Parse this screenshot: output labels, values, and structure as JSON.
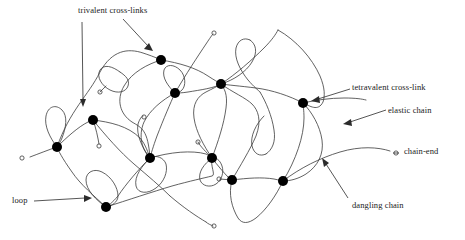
{
  "figure": {
    "type": "polymer-network-diagram",
    "width": 465,
    "height": 240,
    "background_color": "#ffffff"
  },
  "style": {
    "chain_color": "#3a3a3a",
    "node_color": "#000000",
    "label_color": "#1a1a1a",
    "leader_color": "#2b2b2b",
    "chain_stroke_width": 0.8,
    "node_radius": 5
  },
  "labels": {
    "trivalent": "trivalent cross-links",
    "tetravalent": "tetravalent cross-link",
    "elastic": "elastic chain",
    "chain_end": "chain-end",
    "dangling": "dangling chain",
    "loop": "loop"
  },
  "legend_items": [
    {
      "name": "trivalent-cross-links",
      "label": "trivalent cross-links",
      "marker": "filled-circle-node",
      "valence": 3
    },
    {
      "name": "tetravalent-cross-link",
      "label": "tetravalent cross-link",
      "marker": "filled-circle-node",
      "valence": 4
    },
    {
      "name": "elastic-chain",
      "label": "elastic chain",
      "marker": "curve-between-nodes"
    },
    {
      "name": "chain-end",
      "label": "chain-end",
      "marker": "small-open-circle"
    },
    {
      "name": "dangling-chain",
      "label": "dangling chain",
      "marker": "curve-with-free-end"
    },
    {
      "name": "loop",
      "label": "loop",
      "marker": "closed-curve-same-node"
    }
  ],
  "cross_links": [
    {
      "id": "n1",
      "x": 161,
      "y": 60,
      "valence": 3
    },
    {
      "id": "n2",
      "x": 221,
      "y": 84,
      "valence": 4
    },
    {
      "id": "n3",
      "x": 175,
      "y": 93,
      "valence": 3
    },
    {
      "id": "n4",
      "x": 303,
      "y": 103,
      "valence": 4
    },
    {
      "id": "n5",
      "x": 93,
      "y": 120,
      "valence": 3
    },
    {
      "id": "n6",
      "x": 57,
      "y": 147,
      "valence": 3
    },
    {
      "id": "n7",
      "x": 150,
      "y": 158,
      "valence": 4
    },
    {
      "id": "n8",
      "x": 212,
      "y": 158,
      "valence": 4
    },
    {
      "id": "n9",
      "x": 232,
      "y": 180,
      "valence": 3
    },
    {
      "id": "n10",
      "x": 283,
      "y": 181,
      "valence": 3
    },
    {
      "id": "n11",
      "x": 106,
      "y": 207,
      "valence": 3
    }
  ],
  "chain_ends": [
    {
      "id": "e1",
      "x": 214,
      "y": 33
    },
    {
      "id": "e2",
      "x": 100,
      "y": 92
    },
    {
      "id": "e3",
      "x": 144,
      "y": 117
    },
    {
      "id": "e4",
      "x": 22,
      "y": 158
    },
    {
      "id": "e5",
      "x": 99,
      "y": 146
    },
    {
      "id": "e6",
      "x": 198,
      "y": 142
    },
    {
      "id": "e7",
      "x": 219,
      "y": 179
    },
    {
      "id": "e8",
      "x": 214,
      "y": 226
    },
    {
      "id": "e9",
      "x": 396,
      "y": 153
    }
  ]
}
